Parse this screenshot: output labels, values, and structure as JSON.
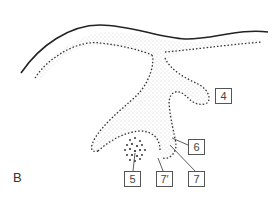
{
  "figure": {
    "panel_letter": "B",
    "labels": [
      {
        "id": "4",
        "text": "4"
      },
      {
        "id": "5",
        "text": "5"
      },
      {
        "id": "6",
        "text": "6"
      },
      {
        "id": "7prime",
        "text": "7′"
      },
      {
        "id": "7",
        "text": "7"
      }
    ],
    "colors": {
      "line": "#222222",
      "stipple": "#888888",
      "box": "#555555"
    }
  }
}
